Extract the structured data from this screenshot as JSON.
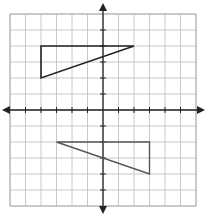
{
  "figure": {
    "type": "coordinate-grid",
    "grid": {
      "x_min": -6,
      "x_max": 6,
      "y_min": -6,
      "y_max": 6,
      "unit": 1,
      "axes_arrows": true,
      "tick_marks": true,
      "tick_labels": false
    },
    "colors": {
      "background": "#ffffff",
      "grid_line": "#c8c8c8",
      "grid_border": "#b0b0b0",
      "axis": "#222222",
      "triangle_upper": "#222222",
      "triangle_lower": "#555555"
    },
    "shapes": [
      {
        "name": "upper-triangle",
        "vertices": [
          [
            -4,
            4
          ],
          [
            2,
            4
          ],
          [
            -4,
            2
          ]
        ]
      },
      {
        "name": "lower-triangle",
        "vertices": [
          [
            -3,
            -2
          ],
          [
            3,
            -2
          ],
          [
            3,
            -4
          ]
        ]
      }
    ]
  }
}
